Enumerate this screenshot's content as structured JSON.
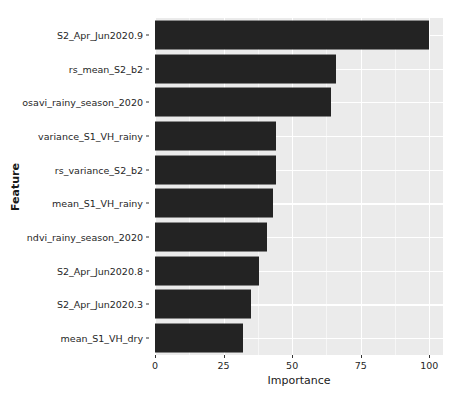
{
  "chart_data": {
    "type": "bar",
    "orientation": "horizontal",
    "title": "",
    "xlabel": "Importance",
    "ylabel": "Feature",
    "categories": [
      "S2_Apr_Jun2020.9",
      "rs_mean_S2_b2",
      "osavi_rainy_season_2020",
      "variance_S1_VH_rainy",
      "rs_variance_S2_b2",
      "mean_S1_VH_rainy",
      "ndvi_rainy_season_2020",
      "S2_Apr_Jun2020.8",
      "S2_Apr_Jun2020.3",
      "mean_S1_VH_dry"
    ],
    "values": [
      100,
      66,
      64,
      44,
      44,
      43,
      41,
      38,
      35,
      32
    ],
    "xlim": [
      0,
      105
    ],
    "xticks": [
      0,
      25,
      50,
      75,
      100
    ],
    "xtick_labels": [
      "0",
      "25",
      "50",
      "75",
      "100"
    ],
    "grid": true,
    "legend": false,
    "bar_color": "#232323",
    "panel_color": "#ebebeb",
    "gridline_color": "#ffffff"
  }
}
